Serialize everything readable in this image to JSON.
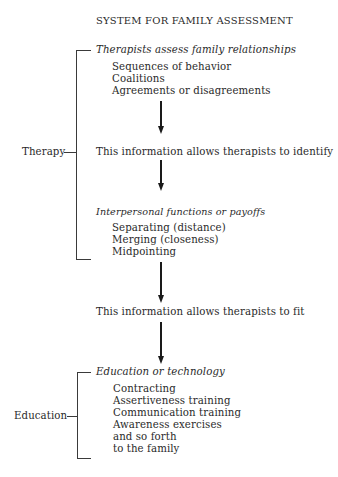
{
  "title": "SYSTEM FOR FAMILY ASSESSMENT",
  "therapy": {
    "label": "Therapy",
    "step1": {
      "heading": "Therapists assess family relationships",
      "items": [
        "Sequences of behavior",
        "Coalitions",
        "Agreements or disagreements"
      ]
    },
    "connector1": "This information allows therapists to identify",
    "step2": {
      "heading": "Interpersonal functions or payoffs",
      "items": [
        "Separating (distance)",
        "Merging (closeness)",
        "Midpointing"
      ]
    }
  },
  "connector2": "This information allows therapists to fit",
  "education": {
    "label": "Education",
    "heading": "Education or technology",
    "items": [
      "Contracting",
      "Assertiveness training",
      "Communication training",
      "Awareness exercises",
      "and so forth",
      "to the family"
    ]
  }
}
